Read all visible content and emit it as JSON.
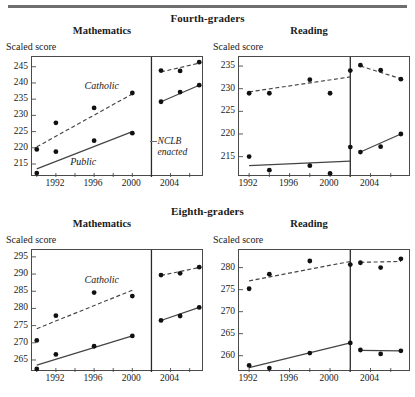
{
  "figure": {
    "groups": [
      {
        "id": "fourth",
        "title": "Fourth-graders"
      },
      {
        "id": "eighth",
        "title": "Eighth-graders"
      }
    ],
    "axis_caption": "Scaled score",
    "series_labels": {
      "catholic": "Catholic",
      "public": "Public"
    },
    "event_label_line1": "NCLB",
    "event_label_line2": "enacted",
    "colors": {
      "frame": "#4a4a4a",
      "marker": "#111111",
      "line": "#444444"
    }
  },
  "chart_data": [
    {
      "id": "grade4-mathematics",
      "type": "scatter",
      "title": "Mathematics",
      "group": "Fourth-graders",
      "xlabel": "",
      "ylabel": "Scaled score",
      "ylim": [
        211,
        248
      ],
      "xlim": [
        1989.5,
        2007.5
      ],
      "yticks": [
        215,
        220,
        225,
        230,
        235,
        240,
        245
      ],
      "xticks": [
        1990,
        1992,
        1994,
        1996,
        1998,
        2000,
        2004,
        2006
      ],
      "xticklabels": [
        "",
        "1992",
        "",
        "1996",
        "",
        "2000",
        "2004",
        ""
      ],
      "grid": false,
      "legend": "inline-annotation",
      "event_line": {
        "label": "NCLB enacted",
        "x": 2002
      },
      "series": [
        {
          "name": "Catholic",
          "style": "dashed",
          "points_pre": [
            {
              "x": 1990,
              "y": 219.5
            },
            {
              "x": 1992,
              "y": 227.7
            },
            {
              "x": 1996,
              "y": 232.3
            },
            {
              "x": 2000,
              "y": 236.9
            }
          ],
          "points_post": [
            {
              "x": 2003,
              "y": 243.8
            },
            {
              "x": 2005,
              "y": 243.7
            },
            {
              "x": 2007,
              "y": 246.4
            }
          ],
          "trend_pre": [
            {
              "x": 1990,
              "y": 220.3
            },
            {
              "x": 2000,
              "y": 236.6
            }
          ],
          "trend_post": [
            {
              "x": 2003,
              "y": 243.4
            },
            {
              "x": 2007,
              "y": 246.1
            }
          ]
        },
        {
          "name": "Public",
          "style": "solid",
          "points_pre": [
            {
              "x": 1990,
              "y": 212.2
            },
            {
              "x": 1992,
              "y": 218.8
            },
            {
              "x": 1996,
              "y": 222.2
            },
            {
              "x": 2000,
              "y": 224.5
            }
          ],
          "points_post": [
            {
              "x": 2003,
              "y": 234.2
            },
            {
              "x": 2005,
              "y": 237.2
            },
            {
              "x": 2007,
              "y": 239.3
            }
          ],
          "trend_pre": [
            {
              "x": 1990,
              "y": 213.5
            },
            {
              "x": 2000,
              "y": 225.0
            }
          ],
          "trend_post": [
            {
              "x": 2003,
              "y": 234.2
            },
            {
              "x": 2007,
              "y": 239.3
            }
          ]
        }
      ]
    },
    {
      "id": "grade4-reading",
      "type": "scatter",
      "title": "Reading",
      "group": "Fourth-graders",
      "xlabel": "",
      "ylabel": "Scaled score",
      "ylim": [
        210.5,
        237
      ],
      "xlim": [
        1991,
        2008
      ],
      "yticks": [
        215,
        220,
        225,
        230,
        235
      ],
      "xticks": [
        1992,
        1994,
        1996,
        1998,
        2000,
        2002,
        2004,
        2006
      ],
      "xticklabels": [
        "1992",
        "",
        "1996",
        "",
        "2000",
        "",
        "2004",
        ""
      ],
      "grid": false,
      "legend": "inline-annotation",
      "event_line": {
        "label": "NCLB enacted",
        "x": 2002
      },
      "series": [
        {
          "name": "Catholic",
          "style": "dashed",
          "points_pre": [
            {
              "x": 1992,
              "y": 229.0
            },
            {
              "x": 1994,
              "y": 229.0
            },
            {
              "x": 1998,
              "y": 232.0
            },
            {
              "x": 2000,
              "y": 229.0
            },
            {
              "x": 2002,
              "y": 234.0
            }
          ],
          "points_post": [
            {
              "x": 2003,
              "y": 235.2
            },
            {
              "x": 2005,
              "y": 234.1
            },
            {
              "x": 2007,
              "y": 232.1
            }
          ],
          "trend_pre": [
            {
              "x": 1992,
              "y": 229.3
            },
            {
              "x": 2002,
              "y": 232.6
            }
          ],
          "trend_post": [
            {
              "x": 2003,
              "y": 235.0
            },
            {
              "x": 2007,
              "y": 232.2
            }
          ]
        },
        {
          "name": "Public",
          "style": "solid",
          "points_pre": [
            {
              "x": 1992,
              "y": 215.0
            },
            {
              "x": 1994,
              "y": 212.0
            },
            {
              "x": 1998,
              "y": 213.0
            },
            {
              "x": 2000,
              "y": 211.3
            },
            {
              "x": 2002,
              "y": 217.1
            }
          ],
          "points_post": [
            {
              "x": 2003,
              "y": 216.0
            },
            {
              "x": 2005,
              "y": 217.2
            },
            {
              "x": 2007,
              "y": 220.0
            }
          ],
          "trend_pre": [
            {
              "x": 1992,
              "y": 213.0
            },
            {
              "x": 2002,
              "y": 214.0
            }
          ],
          "trend_post": [
            {
              "x": 2003,
              "y": 216.0
            },
            {
              "x": 2007,
              "y": 220.0
            }
          ]
        }
      ]
    },
    {
      "id": "grade8-mathematics",
      "type": "scatter",
      "title": "Mathematics",
      "group": "Eighth-graders",
      "xlabel": "",
      "ylabel": "Scaled score",
      "ylim": [
        261.5,
        297
      ],
      "xlim": [
        1989.5,
        2007.5
      ],
      "yticks": [
        265,
        270,
        275,
        280,
        285,
        290,
        295
      ],
      "xticks": [
        1990,
        1992,
        1994,
        1996,
        1998,
        2000,
        2004,
        2006
      ],
      "xticklabels": [
        "",
        "1992",
        "",
        "1996",
        "",
        "2000",
        "2004",
        ""
      ],
      "grid": false,
      "legend": "inline-annotation",
      "event_line": {
        "label": "NCLB enacted",
        "x": 2002
      },
      "series": [
        {
          "name": "Catholic",
          "style": "dashed",
          "points_pre": [
            {
              "x": 1990,
              "y": 270.7
            },
            {
              "x": 1992,
              "y": 277.9
            },
            {
              "x": 1996,
              "y": 284.6
            },
            {
              "x": 2000,
              "y": 283.6
            }
          ],
          "points_post": [
            {
              "x": 2003,
              "y": 289.7
            },
            {
              "x": 2005,
              "y": 290.2
            },
            {
              "x": 2007,
              "y": 292.0
            }
          ],
          "trend_pre": [
            {
              "x": 1990,
              "y": 274.1
            },
            {
              "x": 2000,
              "y": 285.3
            }
          ],
          "trend_post": [
            {
              "x": 2003,
              "y": 289.6
            },
            {
              "x": 2007,
              "y": 291.9
            }
          ]
        },
        {
          "name": "Public",
          "style": "solid",
          "points_pre": [
            {
              "x": 1990,
              "y": 262.4
            },
            {
              "x": 1992,
              "y": 266.6
            },
            {
              "x": 1996,
              "y": 269.0
            },
            {
              "x": 2000,
              "y": 272.0
            }
          ],
          "points_post": [
            {
              "x": 2003,
              "y": 276.5
            },
            {
              "x": 2005,
              "y": 277.8
            },
            {
              "x": 2007,
              "y": 280.3
            }
          ],
          "trend_pre": [
            {
              "x": 1990,
              "y": 263.5
            },
            {
              "x": 2000,
              "y": 272.0
            }
          ],
          "trend_post": [
            {
              "x": 2003,
              "y": 276.5
            },
            {
              "x": 2007,
              "y": 280.3
            }
          ]
        }
      ]
    },
    {
      "id": "grade8-reading",
      "type": "scatter",
      "title": "Reading",
      "group": "Eighth-graders",
      "xlabel": "",
      "ylabel": "Scaled score",
      "ylim": [
        256.3,
        284
      ],
      "xlim": [
        1991,
        2008
      ],
      "yticks": [
        260,
        265,
        270,
        275,
        280
      ],
      "xticks": [
        1992,
        1994,
        1996,
        1998,
        2000,
        2002,
        2004,
        2006
      ],
      "xticklabels": [
        "1992",
        "",
        "1996",
        "",
        "2000",
        "",
        "2004",
        ""
      ],
      "grid": false,
      "legend": "inline-annotation",
      "event_line": {
        "label": "NCLB enacted",
        "x": 2002
      },
      "series": [
        {
          "name": "Catholic",
          "style": "dashed",
          "points_pre": [
            {
              "x": 1992,
              "y": 275.2
            },
            {
              "x": 1994,
              "y": 278.5
            },
            {
              "x": 1998,
              "y": 281.5
            },
            {
              "x": 2002,
              "y": 280.7
            }
          ],
          "points_post": [
            {
              "x": 2003,
              "y": 281.1
            },
            {
              "x": 2005,
              "y": 280.0
            },
            {
              "x": 2007,
              "y": 282.0
            }
          ],
          "trend_pre": [
            {
              "x": 1992,
              "y": 277.0
            },
            {
              "x": 2002,
              "y": 281.4
            }
          ],
          "trend_post": [
            {
              "x": 2003,
              "y": 281.2
            },
            {
              "x": 2007,
              "y": 281.4
            }
          ]
        },
        {
          "name": "Public",
          "style": "solid",
          "points_pre": [
            {
              "x": 1992,
              "y": 257.8
            },
            {
              "x": 1994,
              "y": 257.2
            },
            {
              "x": 1998,
              "y": 260.6
            },
            {
              "x": 2002,
              "y": 262.9
            }
          ],
          "points_post": [
            {
              "x": 2003,
              "y": 261.3
            },
            {
              "x": 2005,
              "y": 260.4
            },
            {
              "x": 2007,
              "y": 261.1
            }
          ],
          "trend_pre": [
            {
              "x": 1992,
              "y": 257.3
            },
            {
              "x": 2002,
              "y": 262.9
            }
          ],
          "trend_post": [
            {
              "x": 2003,
              "y": 261.2
            },
            {
              "x": 2007,
              "y": 261.1
            }
          ]
        }
      ]
    }
  ]
}
